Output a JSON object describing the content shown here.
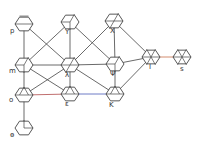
{
  "diagram": {
    "type": "graph",
    "node_shape": "hexagon",
    "colors": {
      "background": "#ffffff",
      "edge_default": "#444444",
      "edge_red": "#b04a4a",
      "edge_blue": "#4a5ab8",
      "edge_orange": "#c8704a",
      "node_stroke": "#444444",
      "accent_green": "#9bd9b0",
      "accent_yellow": "#e9f0a8",
      "accent_purple": "#8a7ab8"
    },
    "nodes": [
      {
        "id": "p",
        "label": "p",
        "x": 24,
        "y": 24,
        "lx": 10,
        "ly": 33,
        "inner": "bar"
      },
      {
        "id": "Y",
        "label": "Y",
        "x": 70,
        "y": 22,
        "lx": 65,
        "ly": 34,
        "inner": "cube"
      },
      {
        "id": "X",
        "label": "X",
        "x": 114,
        "y": 21,
        "lx": 110,
        "ly": 33,
        "inner": "slash"
      },
      {
        "id": "m",
        "label": "m",
        "x": 24,
        "y": 65,
        "lx": 9,
        "ly": 73,
        "inner": "cube"
      },
      {
        "id": "λ",
        "label": "λ",
        "x": 70,
        "y": 65,
        "lx": 65,
        "ly": 77,
        "inner": "slash"
      },
      {
        "id": "Ψ",
        "label": "Ψ",
        "x": 115,
        "y": 64,
        "lx": 110,
        "ly": 76,
        "inner": "cube"
      },
      {
        "id": "I",
        "label": "I",
        "x": 151,
        "y": 57,
        "lx": 149,
        "ly": 69,
        "inner": "star"
      },
      {
        "id": "s",
        "label": "s",
        "x": 182,
        "y": 57,
        "lx": 180,
        "ly": 71,
        "inner": "star"
      },
      {
        "id": "o",
        "label": "o",
        "x": 24,
        "y": 95,
        "lx": 9,
        "ly": 102,
        "inner": "tri"
      },
      {
        "id": "ε",
        "label": "ε",
        "x": 70,
        "y": 94,
        "lx": 65,
        "ly": 106,
        "inner": "tri"
      },
      {
        "id": "K",
        "label": "K",
        "x": 115,
        "y": 94,
        "lx": 109,
        "ly": 107,
        "inner": "tri"
      },
      {
        "id": "ө",
        "label": "ө",
        "x": 24,
        "y": 128,
        "lx": 10,
        "ly": 137,
        "inner": "tick"
      }
    ],
    "edges": [
      {
        "from": "p",
        "to": "m",
        "color": "default"
      },
      {
        "from": "p",
        "to": "λ",
        "color": "default"
      },
      {
        "from": "Y",
        "to": "m",
        "color": "default"
      },
      {
        "from": "Y",
        "to": "λ",
        "color": "default"
      },
      {
        "from": "Y",
        "to": "Ψ",
        "color": "default"
      },
      {
        "from": "X",
        "to": "λ",
        "color": "default"
      },
      {
        "from": "X",
        "to": "Ψ",
        "color": "default"
      },
      {
        "from": "X",
        "to": "I",
        "color": "default"
      },
      {
        "from": "m",
        "to": "λ",
        "color": "default"
      },
      {
        "from": "m",
        "to": "o",
        "color": "default"
      },
      {
        "from": "m",
        "to": "ε",
        "color": "default"
      },
      {
        "from": "λ",
        "to": "Ψ",
        "color": "default"
      },
      {
        "from": "λ",
        "to": "o",
        "color": "default"
      },
      {
        "from": "λ",
        "to": "ε",
        "color": "default"
      },
      {
        "from": "λ",
        "to": "K",
        "color": "default"
      },
      {
        "from": "Ψ",
        "to": "I",
        "color": "default"
      },
      {
        "from": "Ψ",
        "to": "K",
        "color": "default"
      },
      {
        "from": "K",
        "to": "I",
        "color": "default"
      },
      {
        "from": "o",
        "to": "ε",
        "color": "red"
      },
      {
        "from": "ε",
        "to": "K",
        "color": "blue"
      },
      {
        "from": "I",
        "to": "s",
        "color": "orange"
      },
      {
        "from": "o",
        "to": "ө",
        "color": "default"
      }
    ]
  }
}
